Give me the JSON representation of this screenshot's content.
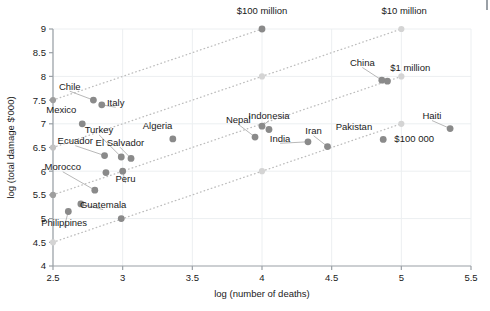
{
  "chart_data": {
    "type": "scatter",
    "title": "",
    "xlabel": "log (number of deaths)",
    "ylabel": "log (total damage $'000)",
    "xlim": [
      2.5,
      5.5
    ],
    "ylim": [
      4,
      9
    ],
    "xticks": [
      "2.5",
      "3",
      "3.5",
      "4",
      "4.5",
      "5",
      "5.5"
    ],
    "xtick_values": [
      2.5,
      3,
      3.5,
      4,
      4.5,
      5,
      5.5
    ],
    "yticks": [
      "4",
      "4.5",
      "5",
      "5.5",
      "6",
      "6.5",
      "7",
      "7.5",
      "8",
      "8.5",
      "9"
    ],
    "ytick_values": [
      4,
      4.5,
      5,
      5.5,
      6,
      6.5,
      7,
      7.5,
      8,
      8.5,
      9
    ],
    "grid": true,
    "legend": "none",
    "marker_color": "#8a8a8a",
    "reference_marker_color": "#c6c6c6",
    "reference_line_color": "#bdbdbd",
    "axis_color": "#9aa0a6",
    "grid_color": "#eceff1",
    "points": [
      {
        "name": "Chile",
        "x": 2.79,
        "y": 7.5,
        "label": "Chile",
        "label_x": 2.62,
        "label_y": 7.72,
        "leader": true
      },
      {
        "name": "Italy",
        "x": 2.85,
        "y": 7.4,
        "label": "Italy",
        "label_x": 2.95,
        "label_y": 7.38,
        "leader": true
      },
      {
        "name": "Mexico",
        "x": 2.71,
        "y": 7.0,
        "label": "Mexico",
        "label_x": 2.56,
        "label_y": 7.22,
        "leader": false
      },
      {
        "name": "Ecuador",
        "x": 2.87,
        "y": 6.33,
        "label": "Ecuador",
        "label_x": 2.66,
        "label_y": 6.57,
        "leader": true
      },
      {
        "name": "Turkey",
        "x": 2.99,
        "y": 6.3,
        "label": "Turkey",
        "label_x": 2.83,
        "label_y": 6.8,
        "leader": true
      },
      {
        "name": "El Salvador",
        "x": 3.06,
        "y": 6.27,
        "label": "El Salvador",
        "label_x": 2.98,
        "label_y": 6.54,
        "leader": true
      },
      {
        "name": "Algeria",
        "x": 3.36,
        "y": 6.68,
        "label": "Algeria",
        "label_x": 3.25,
        "label_y": 6.88,
        "leader": false
      },
      {
        "name": "Morocco-upper",
        "x": 2.88,
        "y": 5.97,
        "label": "",
        "label_x": 0,
        "label_y": 0,
        "leader": false
      },
      {
        "name": "Peru",
        "x": 3.0,
        "y": 6.0,
        "label": "Peru",
        "label_x": 3.02,
        "label_y": 5.78,
        "leader": true
      },
      {
        "name": "Morocco",
        "x": 2.8,
        "y": 5.6,
        "label": "Morocco",
        "label_x": 2.57,
        "label_y": 6.02,
        "leader": true
      },
      {
        "name": "Guatemala",
        "x": 2.7,
        "y": 5.31,
        "label": "Guatemala",
        "label_x": 2.86,
        "label_y": 5.22,
        "leader": true
      },
      {
        "name": "Philippines",
        "x": 2.61,
        "y": 5.15,
        "label": "Philippines",
        "label_x": 2.58,
        "label_y": 4.85,
        "leader": true
      },
      {
        "name": "Guatemala-low",
        "x": 2.99,
        "y": 5.0,
        "label": "",
        "label_x": 0,
        "label_y": 0,
        "leader": false
      },
      {
        "name": "Nepal",
        "x": 3.95,
        "y": 6.72,
        "label": "Nepal",
        "label_x": 3.83,
        "label_y": 7.02,
        "leader": true
      },
      {
        "name": "Indonesia",
        "x": 4.0,
        "y": 6.95,
        "label": "Indonesia",
        "label_x": 4.05,
        "label_y": 7.1,
        "leader": true
      },
      {
        "name": "Indonesia-b",
        "x": 4.05,
        "y": 6.88,
        "label": "",
        "label_x": 0,
        "label_y": 0,
        "leader": false
      },
      {
        "name": "India",
        "x": 4.33,
        "y": 6.62,
        "label": "India",
        "label_x": 4.13,
        "label_y": 6.62,
        "leader": true
      },
      {
        "name": "Iran",
        "x": 4.47,
        "y": 6.52,
        "label": "Iran",
        "label_x": 4.37,
        "label_y": 6.78,
        "leader": true
      },
      {
        "name": "Pakistan",
        "x": 4.87,
        "y": 6.67,
        "label": "Pakistan",
        "label_x": 4.66,
        "label_y": 6.86,
        "leader": false
      },
      {
        "name": "Haiti",
        "x": 5.35,
        "y": 6.9,
        "label": "Haiti",
        "label_x": 5.22,
        "label_y": 7.1,
        "leader": true
      },
      {
        "name": "China",
        "x": 4.86,
        "y": 7.92,
        "label": "China",
        "label_x": 4.72,
        "label_y": 8.22,
        "leader": true
      },
      {
        "name": "China-b",
        "x": 4.9,
        "y": 7.9,
        "label": "",
        "label_x": 0,
        "label_y": 0,
        "leader": false
      },
      {
        "name": "hundred-million-point",
        "x": 4.0,
        "y": 9.0,
        "label": "",
        "label_x": 0,
        "label_y": 0,
        "leader": false
      }
    ],
    "reference_points": [
      {
        "x": 2.5,
        "y": 7.5,
        "shade": "dark"
      },
      {
        "x": 2.5,
        "y": 6.5,
        "shade": "mid"
      },
      {
        "x": 2.5,
        "y": 5.5,
        "shade": "dark"
      },
      {
        "x": 2.5,
        "y": 4.5,
        "shade": "light"
      },
      {
        "x": 4.0,
        "y": 8.0,
        "shade": "light"
      },
      {
        "x": 4.0,
        "y": 6.0,
        "shade": "light"
      },
      {
        "x": 5.0,
        "y": 9.0,
        "shade": "light"
      },
      {
        "x": 5.0,
        "y": 8.0,
        "shade": "light"
      },
      {
        "x": 5.0,
        "y": 7.0,
        "shade": "light"
      }
    ],
    "reference_lines": [
      {
        "x1": 2.5,
        "y1": 7.5,
        "x2": 4.0,
        "y2": 9.0
      },
      {
        "x1": 4.0,
        "y1": 8.0,
        "x2": 5.0,
        "y2": 9.0
      },
      {
        "x1": 2.5,
        "y1": 6.5,
        "x2": 4.0,
        "y2": 8.0
      },
      {
        "x1": 4.0,
        "y1": 6.0,
        "x2": 5.0,
        "y2": 7.0
      },
      {
        "x1": 2.5,
        "y1": 5.5,
        "x2": 4.0,
        "y2": 7.0
      },
      {
        "x1": 5.0,
        "y1": 8.0,
        "x2": 4.0,
        "y2": 7.0
      },
      {
        "x1": 2.5,
        "y1": 4.5,
        "x2": 4.0,
        "y2": 6.0
      }
    ],
    "annotations": [
      {
        "text": "$100 million",
        "x": 4.0,
        "y": 9.32,
        "anchor": "middle"
      },
      {
        "text": "$10 million",
        "x": 5.02,
        "y": 9.32,
        "anchor": "middle"
      },
      {
        "text": "$1 million",
        "x": 4.92,
        "y": 8.12,
        "anchor": "start"
      },
      {
        "text": "$100 000",
        "x": 4.95,
        "y": 6.62,
        "anchor": "start"
      }
    ]
  }
}
